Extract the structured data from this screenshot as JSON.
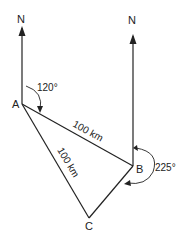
{
  "diagram": {
    "points": {
      "A": "A",
      "B": "B",
      "C": "C"
    },
    "north_labels": [
      "N",
      "N"
    ],
    "edges": {
      "AB": "100 km",
      "AC": "100 km"
    },
    "angles": {
      "A": "120°",
      "B": "225°"
    },
    "color": "#222222"
  }
}
